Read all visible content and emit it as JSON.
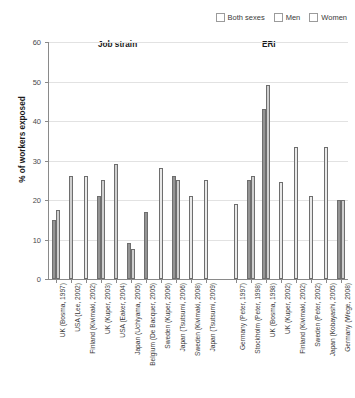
{
  "chart_data": {
    "type": "bar",
    "title": "",
    "xlabel": "",
    "ylabel": "% of workers exposed",
    "ylim": [
      0,
      60
    ],
    "yticks": [
      0,
      10,
      20,
      30,
      40,
      50,
      60
    ],
    "grid": true,
    "legend_position": "top-right",
    "legend": [
      "Both sexes",
      "Men",
      "Women"
    ],
    "sections": [
      {
        "name": "Job strain",
        "start_index": 0,
        "end_index": 10
      },
      {
        "name": "ERI",
        "start_index": 11,
        "end_index": 18
      }
    ],
    "categories": [
      "UK (Bosma, 1997)",
      "USA (Lee, 2002)",
      "Finland (Kivimaki, 2002)",
      "UK (Kuper, 2003)",
      "USA (Eaker, 2004)",
      "Japan (Uchiyama, 2005)",
      "Belgium (De Bacquer, 2005)",
      "Sweden (Kuper, 2006)",
      "Japan (Tsutsumi, 2006)",
      "Sweden (Kivimaki, 2008)",
      "Japan (Tsutsumi, 2009)",
      "Germany (Peter, 1997)",
      "Stockholm (Peter, 1998)",
      "UK (Bosma, 1998)",
      "UK (Kuper, 2002)",
      "Finland (Kivimaki, 2002)",
      "Sweden (Peter, 2002)",
      "Japan (Kobayashi, 2005)",
      "Germany (Wege, 2008)"
    ],
    "series": [
      {
        "name": "Both sexes",
        "values": [
          null,
          null,
          null,
          null,
          null,
          null,
          null,
          null,
          null,
          null,
          null,
          null,
          null,
          null,
          null,
          null,
          null,
          null,
          null
        ]
      },
      {
        "name": "Men",
        "values": [
          15.0,
          26.0,
          26.0,
          21.0,
          29.0,
          9.0,
          7.5,
          17.0,
          26.0,
          21.0,
          25.0,
          19.0,
          25.0,
          43.0,
          24.5,
          21.0,
          33.5,
          20.0,
          20.0
        ]
      },
      {
        "name": "Women",
        "values": [
          17.5,
          null,
          null,
          25.0,
          null,
          7.5,
          null,
          null,
          25.0,
          null,
          null,
          null,
          26.0,
          49.0,
          null,
          null,
          null,
          33.5,
          20.0
        ]
      }
    ],
    "bars": [
      {
        "category": "UK (Bosma, 1997)",
        "points": [
          {
            "series": "Men",
            "value": 15.0
          },
          {
            "series": "Women",
            "value": 17.5
          }
        ]
      },
      {
        "category": "USA (Lee, 2002)",
        "points": [
          {
            "series": "Women",
            "value": 26.0
          }
        ]
      },
      {
        "category": "Finland (Kivimaki, 2002)",
        "points": [
          {
            "series": "Both sexes",
            "value": 26.0
          }
        ]
      },
      {
        "category": "UK (Kuper, 2003)",
        "points": [
          {
            "series": "Men",
            "value": 21.0
          },
          {
            "series": "Women",
            "value": 25.0
          }
        ]
      },
      {
        "category": "USA (Eaker, 2004)",
        "points": [
          {
            "series": "Women",
            "value": 29.0
          }
        ]
      },
      {
        "category": "Japan (Uchiyama, 2005)",
        "points": [
          {
            "series": "Men",
            "value": 9.0
          },
          {
            "series": "Women",
            "value": 7.5
          }
        ]
      },
      {
        "category": "Belgium (De Bacquer, 2005)",
        "points": [
          {
            "series": "Men",
            "value": 17.0
          }
        ]
      },
      {
        "category": "Sweden (Kuper, 2006)",
        "points": [
          {
            "series": "Both sexes",
            "value": 28.0
          }
        ]
      },
      {
        "category": "Japan (Tsutsumi, 2006)",
        "points": [
          {
            "series": "Men",
            "value": 26.0
          },
          {
            "series": "Women",
            "value": 25.0
          }
        ]
      },
      {
        "category": "Sweden (Kivimaki, 2008)",
        "points": [
          {
            "series": "Both sexes",
            "value": 21.0
          }
        ]
      },
      {
        "category": "Japan (Tsutsumi, 2009)",
        "points": [
          {
            "series": "Both sexes",
            "value": 25.0
          }
        ]
      },
      {
        "category": "Germany (Peter, 1997)",
        "points": [
          {
            "series": "Both sexes",
            "value": 19.0
          }
        ]
      },
      {
        "category": "Stockholm (Peter, 1998)",
        "points": [
          {
            "series": "Men",
            "value": 25.0
          },
          {
            "series": "Women",
            "value": 26.0
          }
        ]
      },
      {
        "category": "UK (Bosma, 1998)",
        "points": [
          {
            "series": "Men",
            "value": 43.0
          },
          {
            "series": "Women",
            "value": 49.0
          }
        ]
      },
      {
        "category": "UK (Kuper, 2002)",
        "points": [
          {
            "series": "Both sexes",
            "value": 24.5
          }
        ]
      },
      {
        "category": "Finland (Kivimaki, 2002)",
        "points": [
          {
            "series": "Both sexes",
            "value": 33.5
          }
        ]
      },
      {
        "category": "Sweden (Peter, 2002)",
        "points": [
          {
            "series": "Both sexes",
            "value": 21.0
          }
        ]
      },
      {
        "category": "Japan (Kobayashi, 2005)",
        "points": [
          {
            "series": "Both sexes",
            "value": 33.5
          }
        ]
      },
      {
        "category": "Germany (Wege, 2008)",
        "points": [
          {
            "series": "Men",
            "value": 20.0
          },
          {
            "series": "Women",
            "value": 20.0
          }
        ]
      }
    ],
    "colors": {
      "both_sexes": "#e9e9e9",
      "men": "#949494",
      "women": "#cfcfcf",
      "axis": "#8a8a8a",
      "grid": "#e2e2e2"
    }
  }
}
